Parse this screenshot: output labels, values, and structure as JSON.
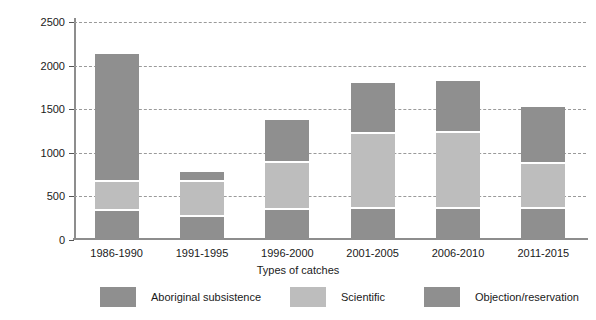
{
  "chart_data": {
    "type": "bar",
    "stacked": true,
    "title": "",
    "xlabel": "Types of catches",
    "ylabel": "Mean annual number of whales caught",
    "categories": [
      "1986-1990",
      "1991-1995",
      "1996-2000",
      "2001-2005",
      "2006-2010",
      "2011-2015"
    ],
    "ylim": [
      0,
      2500
    ],
    "yticks": [
      0,
      500,
      1000,
      1500,
      2000,
      2500
    ],
    "ytick_labels": [
      "0",
      "500",
      "1000",
      "1500",
      "2000",
      "2500"
    ],
    "grid": "horizontal-dashed",
    "legend_position": "bottom",
    "series": [
      {
        "name": "Aboriginal subsistence",
        "color": "#8f8f8f",
        "values": [
          330,
          260,
          345,
          360,
          360,
          360
        ]
      },
      {
        "name": "Scientific",
        "color": "#bdbdbd",
        "values": [
          335,
          410,
          535,
          855,
          865,
          510
        ]
      },
      {
        "name": "Objection/reservation",
        "color": "#8f8f8f",
        "values": [
          1465,
          105,
          495,
          590,
          595,
          650
        ]
      }
    ],
    "totals": [
      2130,
      775,
      1375,
      1805,
      1820,
      1520
    ]
  },
  "axes": {
    "y_title": "Mean annual number of whales caught",
    "x_title": "Types of catches"
  }
}
